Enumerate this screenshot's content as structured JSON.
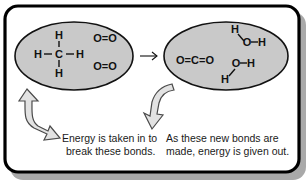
{
  "figure": {
    "frame": {
      "border_color": "#000000",
      "background_color": "#ffffff",
      "shadow_color": "#a9a9a9"
    },
    "reaction_arrow": "→",
    "reactants": {
      "oval_label": "reactants-oval",
      "fill_color": "#c9c9c9",
      "molecules": [
        {
          "name": "methane",
          "atoms": {
            "top_h": "H",
            "left_h": "H",
            "center_c": "C",
            "right_h": "H",
            "bottom_h": "H"
          },
          "left_bond": "–",
          "right_bond": "–"
        },
        {
          "name": "oxygen-1",
          "formula": "O=O"
        },
        {
          "name": "oxygen-2",
          "formula": "O=O"
        }
      ]
    },
    "products": {
      "oval_label": "products-oval",
      "fill_color": "#c9c9c9",
      "molecules": [
        {
          "name": "carbon-dioxide",
          "formula": "O=C=O"
        },
        {
          "name": "water-1",
          "atoms": {
            "h_upper": "H",
            "o": "O",
            "bond": "–",
            "h_right": "H"
          }
        },
        {
          "name": "water-2",
          "atoms": {
            "o": "O",
            "bond": "–",
            "h_right": "H",
            "h_lower": "H"
          }
        }
      ]
    },
    "annotations": [
      {
        "name": "energy-in-annotation",
        "arrow_direction": "up",
        "arrow_fill": "#e2e2e2",
        "arrow_stroke": "#4a4a4a",
        "line1": "Energy is taken in to",
        "line2": "break these bonds."
      },
      {
        "name": "energy-out-annotation",
        "arrow_direction": "down",
        "arrow_fill": "#e2e2e2",
        "arrow_stroke": "#4a4a4a",
        "line1": "As these new bonds are",
        "line2": "made, energy is given out."
      }
    ]
  }
}
